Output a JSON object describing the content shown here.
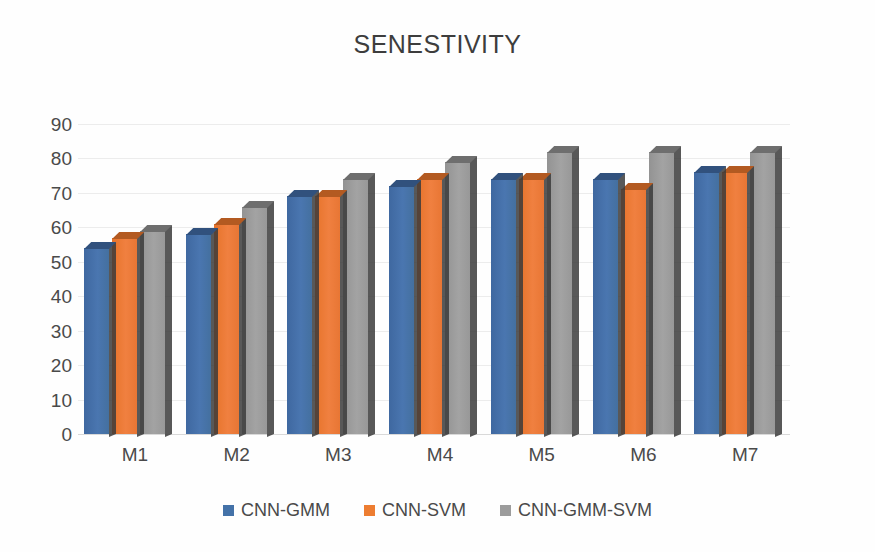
{
  "chart_data": {
    "type": "bar",
    "title": "SENESTIVITY",
    "xlabel": "",
    "ylabel": "",
    "categories": [
      "M1",
      "M2",
      "M3",
      "M4",
      "M5",
      "M6",
      "M7"
    ],
    "series": [
      {
        "name": "CNN-GMM",
        "color": "#4472a8",
        "values": [
          54,
          58,
          69,
          72,
          74,
          74,
          76
        ]
      },
      {
        "name": "CNN-SVM",
        "color": "#ed7d31",
        "values": [
          57,
          61,
          69,
          74,
          74,
          71,
          76
        ]
      },
      {
        "name": "CNN-GMM-SVM",
        "color": "#9c9c9c",
        "values": [
          59,
          66,
          74,
          79,
          82,
          82,
          82
        ]
      }
    ],
    "ylim": [
      0,
      90
    ],
    "yticks": [
      90,
      80,
      70,
      60,
      50,
      40,
      30,
      20,
      10,
      0
    ],
    "ytick_labels": [
      "90",
      "80",
      "70",
      "60",
      "50",
      "40",
      "30",
      "20",
      "10",
      "0"
    ],
    "grid": true,
    "legend_position": "bottom",
    "style": "3d-clustered-column"
  }
}
